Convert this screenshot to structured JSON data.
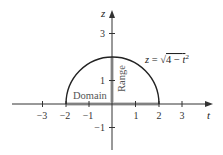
{
  "diagram": {
    "axes": {
      "horizontal": {
        "label": "t",
        "ticks": [
          "−3",
          "−2",
          "−1",
          "1",
          "2",
          "3"
        ]
      },
      "vertical": {
        "label": "z",
        "ticks": [
          "3",
          "1",
          "−1"
        ]
      }
    },
    "curve": {
      "equation": "z = √4 − t²",
      "eq_prefix": "z = √",
      "eq_body": "4 − t",
      "eq_exp": "2",
      "type": "semicircle",
      "radius": 2
    },
    "regions": {
      "domain_label": "Domain",
      "range_label": "Range",
      "domain": [
        -2,
        2
      ],
      "range": [
        0,
        2
      ]
    },
    "colors": {
      "curve": "#222222",
      "axes": "#333333",
      "highlight": "#c8c8c8"
    }
  }
}
